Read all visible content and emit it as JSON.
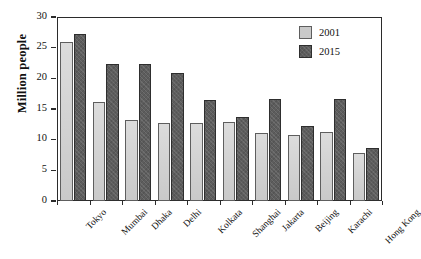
{
  "chart_data": {
    "type": "bar",
    "title": "",
    "xlabel": "",
    "ylabel": "Million people",
    "ylim": [
      0,
      30
    ],
    "yticks": [
      0,
      5,
      10,
      15,
      20,
      25,
      30
    ],
    "ytick_labels": [
      "0",
      "5",
      "10",
      "15",
      "20",
      "25",
      "30"
    ],
    "grid": false,
    "legend_position": "top-right",
    "categories": [
      "Tokyo",
      "Mumbai",
      "Dhaka",
      "Delhi",
      "Kolkata",
      "Shanghai",
      "Jakarta",
      "Beijing",
      "Karachi",
      "Hong Kong"
    ],
    "series": [
      {
        "name": "2001",
        "color": "#c9c9c9",
        "values": [
          26.0,
          16.1,
          13.2,
          12.7,
          12.8,
          12.9,
          11.1,
          10.7,
          11.2,
          7.9
        ]
      },
      {
        "name": "2015",
        "color": "#5d5d5d",
        "values": [
          27.3,
          22.3,
          22.4,
          20.8,
          16.5,
          13.7,
          16.7,
          12.3,
          16.6,
          8.7
        ]
      }
    ]
  },
  "legend": {
    "items": [
      {
        "label": "2001"
      },
      {
        "label": "2015"
      }
    ]
  },
  "axes": {
    "y_title": "Million people"
  }
}
